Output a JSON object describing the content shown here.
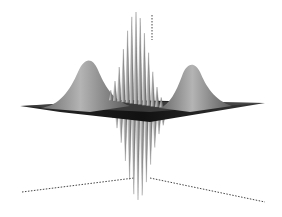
{
  "chart_data": {
    "type": "surface",
    "title": "",
    "xlabel": "",
    "ylabel": "",
    "zlabel": "",
    "grid": false,
    "legend": null,
    "features": [
      {
        "name": "left-gaussian-peak",
        "x": -1,
        "height": 0.5
      },
      {
        "name": "right-gaussian-peak",
        "x": 1,
        "height": 0.5
      },
      {
        "name": "central-interference-fringes",
        "x": 0,
        "max_height": 1.0,
        "min_height": -1.0,
        "fringe_count": 13
      }
    ],
    "axes_style": "dotted"
  },
  "colors": {
    "background": "#ffffff",
    "surface_light": "#c8c8c8",
    "surface_dark": "#1a1a1a",
    "axis": "#444444"
  }
}
